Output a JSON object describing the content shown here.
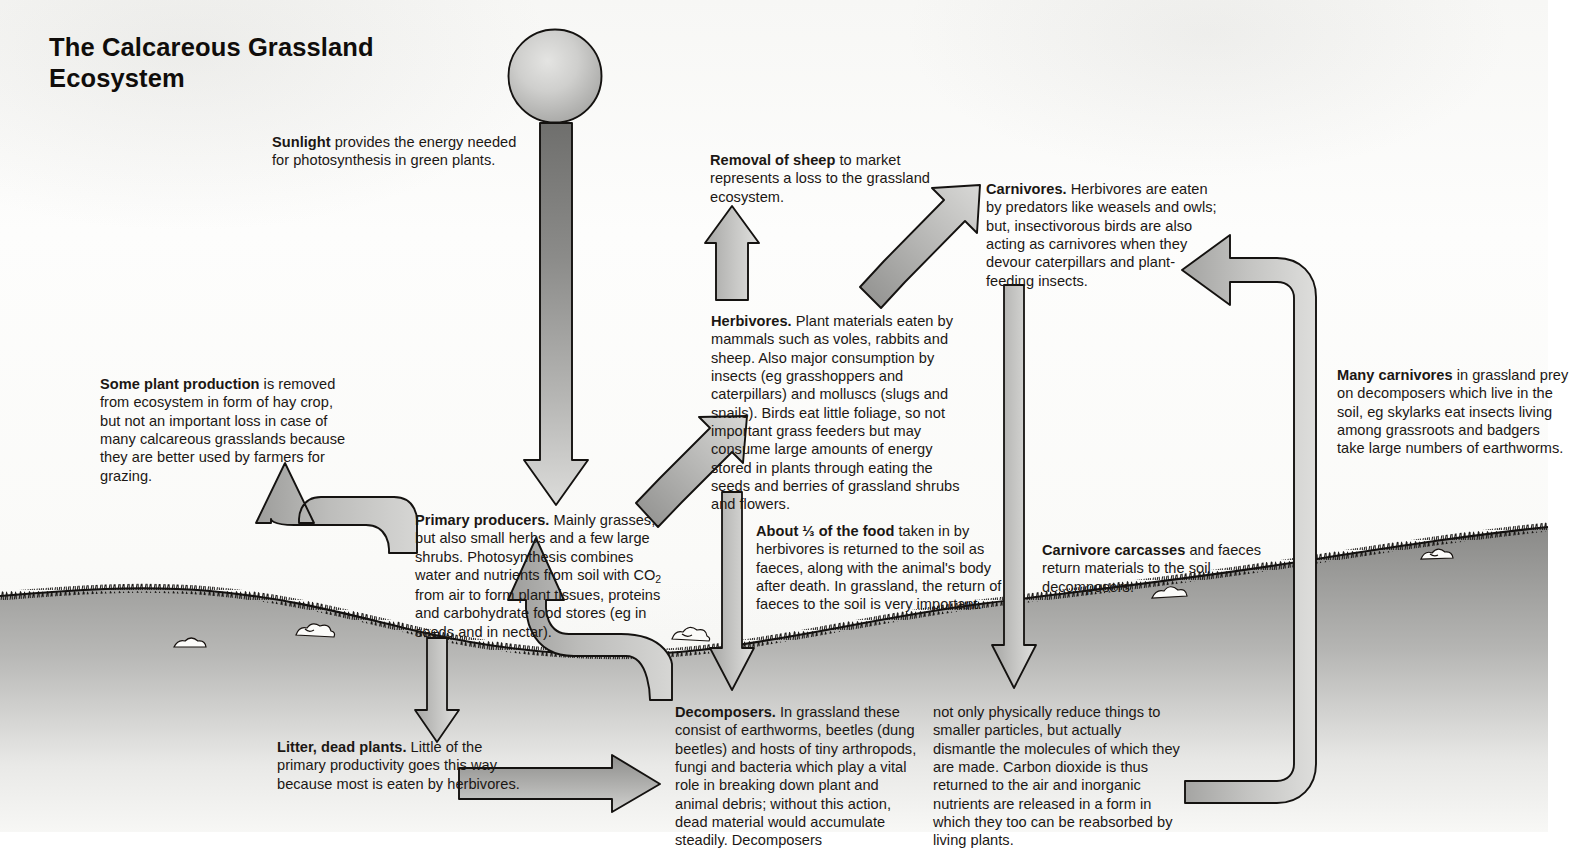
{
  "title": "The Calcareous Grassland Ecosystem",
  "colors": {
    "arrow_fill_light": "#c9c9c7",
    "arrow_fill_dark": "#8e8e8c",
    "arrow_stroke": "#100d0b",
    "ground_dark": "#8a8a88",
    "ground_light": "#f2f2f0",
    "text": "#1b1714",
    "paper": "#fafaf8"
  },
  "blocks": {
    "sunlight": {
      "lead": "Sunlight",
      "rest": " provides the energy needed for photosynthesis in green plants."
    },
    "removal_of_sheep": {
      "lead": "Removal of sheep",
      "rest": " to market represents a loss to the grassland ecosystem."
    },
    "carnivores": {
      "lead": "Carnivores.",
      "rest": " Herbivores are eaten by predators like weasels and owls; but, insectivorous birds are also acting as carnivores when they devour caterpillars and plant-feeding insects."
    },
    "some_plant_production": {
      "lead": "Some plant production",
      "rest": " is removed from ecosystem in form of hay crop, but not an important loss in case of many calcareous grasslands because they are better used by farmers for grazing."
    },
    "herbivores": {
      "lead": "Herbivores.",
      "rest": " Plant materials eaten by mammals such as voles, rabbits and sheep. Also major consumption by insects (eg grasshoppers and caterpillars) and molluscs (slugs and snails). Birds eat little foliage, so not important grass feeders but may consume large amounts of energy stored in plants through eating the seeds and berries of grassland shrubs and flowers."
    },
    "many_carnivores": {
      "lead": "Many carnivores",
      "rest": " in grassland prey on decomposers which live in the soil, eg skylarks eat insects living among grassroots and badgers take large numbers of earthworms."
    },
    "primary_producers": {
      "lead": "Primary producers.",
      "part1": " Mainly grasses, but also small herbs and a few large shrubs. Photosynthesis combines water and nutrients from soil with CO",
      "sub": "2",
      "part2": " from air to form plant tissues, proteins and carbohydrate food stores (eg in seeds and in nectar)."
    },
    "about_third": {
      "lead": "About ⅓ of the food",
      "rest": " taken in by herbivores is returned to the soil as faeces, along with the animal's body after death. In grassland, the return of faeces to the soil is very important."
    },
    "carnivore_carcasses": {
      "lead": "Carnivore carcasses",
      "rest": " and faeces return materials to the soil decomposers."
    },
    "litter_dead_plants": {
      "lead": "Litter, dead plants.",
      "rest": " Little of the primary productivity goes this way because most is eaten by herbivores."
    },
    "decomposers_col1": {
      "lead": "Decomposers.",
      "rest": " In grassland these consist of earthworms, beetles (dung beetles) and hosts of tiny arthropods, fungi and bacteria which play a vital role in breaking down plant and animal debris; without this action, dead material would accumulate steadily. Decomposers"
    },
    "decomposers_col2": {
      "lead": "",
      "rest": "not only physically reduce things to smaller particles, but actually dismantle the molecules of which they are made. Carbon dioxide is thus returned to the air and inorganic nutrients are released in a form in which they too can be reabsorbed by living plants."
    }
  },
  "graphics": {
    "sun": "sun-disc",
    "arrows": [
      {
        "name": "sunlight-to-producers-arrow",
        "direction": "down"
      },
      {
        "name": "producers-to-hay-crop-arrow",
        "direction": "curve-up-left"
      },
      {
        "name": "producers-to-litter-arrow",
        "direction": "down"
      },
      {
        "name": "producers-to-herbivores-arrow",
        "direction": "up-right-diagonal"
      },
      {
        "name": "herbivores-to-removal-arrow",
        "direction": "up"
      },
      {
        "name": "herbivores-to-carnivores-arrow",
        "direction": "up-right-diagonal"
      },
      {
        "name": "herbivores-to-decomposers-arrow",
        "direction": "down"
      },
      {
        "name": "carnivores-to-decomposers-arrow",
        "direction": "down"
      },
      {
        "name": "litter-to-decomposers-arrow",
        "direction": "right"
      },
      {
        "name": "decomposers-to-producers-arrow",
        "direction": "curve-up-left"
      },
      {
        "name": "decomposers-to-carnivores-return-arrow",
        "direction": "curve-up-then-left"
      }
    ]
  }
}
